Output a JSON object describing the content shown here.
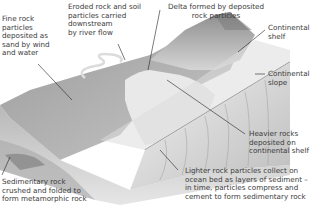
{
  "diagram": {
    "labels": {
      "fine_rock": "Fine rock\nparticles\ndeposited as\nsand by wind\nand water",
      "eroded_rock": "Eroded rock and soil\nparticles carried\ndownstream\nby river flow",
      "delta": "Delta formed by deposited\nrock particles",
      "continental_shelf": "Continental\nshelf",
      "continental_slope": "Continental\nslope",
      "heavier_rocks": "Heavier rocks\ndeposited on\ncontinental shelf",
      "sedimentary_rock": "Sedimentary rock\ncrushed and folded to\nform metamorphic rock",
      "lighter_rock": "Lighter rock particles collect on\nocean bed as layers of sediment –\nin time, particles compress and\ncement to form sedimentary rock"
    }
  }
}
